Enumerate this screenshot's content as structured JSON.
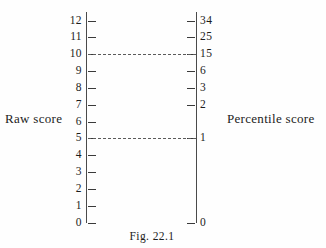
{
  "figure": {
    "caption": "Fig. 22.1",
    "left_axis_title": "Raw score",
    "right_axis_title": "Percentile score"
  },
  "chart_data": {
    "type": "table",
    "title": "Fig. 22.1",
    "xlabel": "",
    "ylabel": "",
    "grid": false,
    "legend": "none",
    "axes": [
      {
        "name": "Raw score",
        "side": "left",
        "range": [
          0,
          12
        ],
        "tick_values": [
          12,
          11,
          10,
          9,
          8,
          7,
          6,
          5,
          4,
          3,
          2,
          1,
          0
        ],
        "tick_labels": [
          "12",
          "11",
          "10",
          "9",
          "8",
          "7",
          "6",
          "5",
          "4",
          "3",
          "2",
          "1",
          "0"
        ]
      },
      {
        "name": "Percentile score",
        "side": "right",
        "tick_values": [
          12,
          11,
          10,
          9,
          8,
          7,
          5,
          0
        ],
        "tick_labels": [
          "34",
          "25",
          "15",
          "6",
          "3",
          "2",
          "1",
          "0"
        ]
      }
    ],
    "rows": [
      {
        "raw": "12",
        "percentile": "34",
        "left_tick": true,
        "right_tick": true,
        "connector": false
      },
      {
        "raw": "11",
        "percentile": "25",
        "left_tick": true,
        "right_tick": true,
        "connector": false
      },
      {
        "raw": "10",
        "percentile": "15",
        "left_tick": true,
        "right_tick": true,
        "connector": true
      },
      {
        "raw": "9",
        "percentile": "6",
        "left_tick": true,
        "right_tick": true,
        "connector": false
      },
      {
        "raw": "8",
        "percentile": "3",
        "left_tick": true,
        "right_tick": true,
        "connector": false
      },
      {
        "raw": "7",
        "percentile": "2",
        "left_tick": true,
        "right_tick": true,
        "connector": false
      },
      {
        "raw": "6",
        "percentile": "",
        "left_tick": true,
        "right_tick": false,
        "connector": false
      },
      {
        "raw": "5",
        "percentile": "1",
        "left_tick": true,
        "right_tick": true,
        "connector": true
      },
      {
        "raw": "4",
        "percentile": "",
        "left_tick": true,
        "right_tick": false,
        "connector": false
      },
      {
        "raw": "3",
        "percentile": "",
        "left_tick": true,
        "right_tick": false,
        "connector": false
      },
      {
        "raw": "2",
        "percentile": "",
        "left_tick": true,
        "right_tick": false,
        "connector": false
      },
      {
        "raw": "1",
        "percentile": "",
        "left_tick": true,
        "right_tick": false,
        "connector": false
      },
      {
        "raw": "0",
        "percentile": "0",
        "left_tick": true,
        "right_tick": true,
        "connector": false
      }
    ],
    "colors": {
      "background": "#fefefe",
      "ink": "#1c1c1c",
      "rule": "#4a4a4a",
      "dash": "#5a5a5a"
    }
  }
}
